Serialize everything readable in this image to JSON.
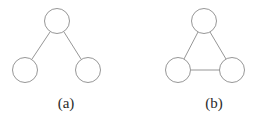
{
  "figure": {
    "background_color": "#ffffff",
    "stroke_color": "#8a8a8a",
    "label_color": "#2b2b2b",
    "stroke_width": 0.9,
    "node_radius": 12.5,
    "panels": [
      {
        "id": "a",
        "label": "(a)",
        "graph_type": "tree",
        "node_count": 3,
        "edge_count": 2,
        "nodes": [
          {
            "id": "a-top",
            "cx": 57,
            "cy": 21,
            "r": 12.5
          },
          {
            "id": "a-bottom-left",
            "cx": 25,
            "cy": 70,
            "r": 12.5
          },
          {
            "id": "a-bottom-right",
            "cx": 88,
            "cy": 70,
            "r": 12.5
          }
        ],
        "edges": [
          {
            "id": "a-edge-left",
            "from": "a-top",
            "to": "a-bottom-left",
            "x1": 50,
            "y1": 32,
            "x2": 32,
            "y2": 59
          },
          {
            "id": "a-edge-right",
            "from": "a-top",
            "to": "a-bottom-right",
            "x1": 64,
            "y1": 32,
            "x2": 81,
            "y2": 59
          }
        ]
      },
      {
        "id": "b",
        "label": "(b)",
        "graph_type": "triangle",
        "node_count": 3,
        "edge_count": 3,
        "nodes": [
          {
            "id": "b-top",
            "cx": 72,
            "cy": 21,
            "r": 12.5
          },
          {
            "id": "b-bottom-left",
            "cx": 46,
            "cy": 70,
            "r": 12.5
          },
          {
            "id": "b-bottom-right",
            "cx": 100,
            "cy": 70,
            "r": 12.5
          }
        ],
        "edges": [
          {
            "id": "b-edge-left",
            "from": "b-top",
            "to": "b-bottom-left",
            "x1": 66,
            "y1": 32,
            "x2": 52,
            "y2": 59
          },
          {
            "id": "b-edge-right",
            "from": "b-top",
            "to": "b-bottom-right",
            "x1": 78,
            "y1": 32,
            "x2": 94,
            "y2": 59
          },
          {
            "id": "b-edge-bottom",
            "from": "b-bottom-left",
            "to": "b-bottom-right",
            "x1": 59,
            "y1": 70,
            "x2": 88,
            "y2": 70
          }
        ]
      }
    ]
  }
}
